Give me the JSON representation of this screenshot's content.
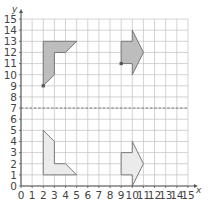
{
  "diagram": {
    "type": "coordinate-grid-reflection",
    "axes": {
      "x_label": "x",
      "y_label": "y",
      "x_ticks": [
        "0",
        "1",
        "2",
        "3",
        "4",
        "5",
        "6",
        "7",
        "8",
        "9",
        "10",
        "11",
        "12",
        "13",
        "14",
        "15"
      ],
      "y_ticks": [
        "0",
        "1",
        "2",
        "3",
        "4",
        "5",
        "6",
        "7",
        "8",
        "9",
        "10",
        "11",
        "12",
        "13",
        "14",
        "15"
      ],
      "x_range": [
        0,
        15
      ],
      "y_range": [
        0,
        15
      ]
    },
    "mirror_line": {
      "y": 7,
      "style": "dashed"
    },
    "shapes": [
      {
        "name": "upper-left-L-shape",
        "fill": "#bdbdbd",
        "points": [
          [
            2,
            9
          ],
          [
            2,
            13
          ],
          [
            5,
            13
          ],
          [
            4,
            12
          ],
          [
            3,
            12
          ],
          [
            3,
            10
          ]
        ],
        "marked_point": [
          2,
          9
        ]
      },
      {
        "name": "upper-right-arrow",
        "fill": "#bdbdbd",
        "points": [
          [
            9,
            11
          ],
          [
            9,
            13
          ],
          [
            10,
            13
          ],
          [
            10,
            14
          ],
          [
            11,
            12
          ],
          [
            10,
            10
          ],
          [
            10,
            11
          ]
        ],
        "marked_point": [
          9,
          11
        ]
      },
      {
        "name": "lower-left-L-shape",
        "fill": "#ebebeb",
        "points": [
          [
            2,
            5
          ],
          [
            2,
            1
          ],
          [
            5,
            1
          ],
          [
            4,
            2
          ],
          [
            3,
            2
          ],
          [
            3,
            4
          ]
        ]
      },
      {
        "name": "lower-right-arrow",
        "fill": "#ebebeb",
        "points": [
          [
            9,
            1
          ],
          [
            9,
            3
          ],
          [
            10,
            3
          ],
          [
            10,
            4
          ],
          [
            11,
            2
          ],
          [
            10,
            0
          ],
          [
            10,
            1
          ]
        ]
      }
    ],
    "colors": {
      "grid": "#c8c8c8",
      "axis": "#555555",
      "outline": "#6e6e6e",
      "mirror_line": "#777777"
    }
  }
}
